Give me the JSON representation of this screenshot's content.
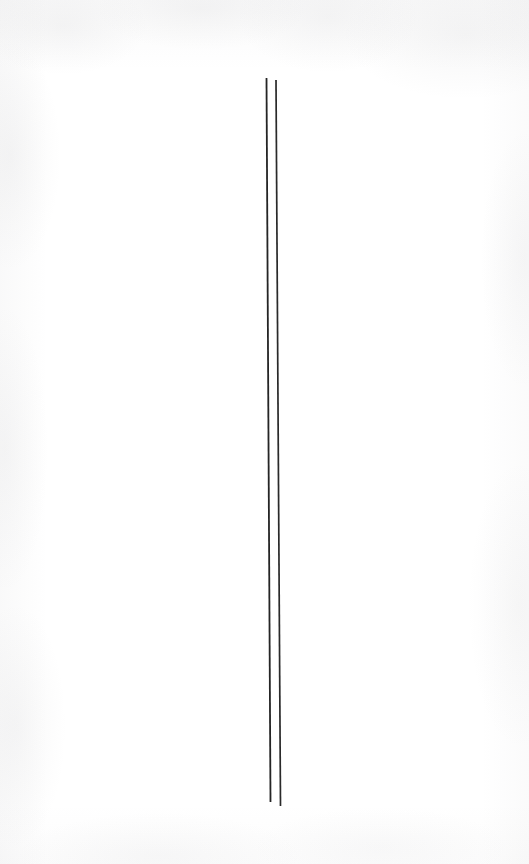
{
  "artwork": {
    "title": "Two Vertical Lines",
    "description": "A minimal composition of two thin, nearly vertical dark strokes on a near-white paper ground.",
    "canvas": {
      "width": 529,
      "height": 864,
      "background_color": "#fefefe",
      "paper_tint": "#ffffff",
      "texture_color": "#8c8c91"
    },
    "strokes": [
      {
        "name": "left-line",
        "color": "#1a1a1a",
        "width": 1.8,
        "x_top": 266.5,
        "y_top": 78,
        "x_bottom": 270.5,
        "y_bottom": 802,
        "opacity": 0.95
      },
      {
        "name": "right-line",
        "color": "#1a1a1a",
        "width": 1.7,
        "x_top": 276.0,
        "y_top": 80,
        "x_bottom": 280.5,
        "y_bottom": 806,
        "opacity": 0.93
      }
    ],
    "gap_top_px": 9.5,
    "gap_bottom_px": 10.0
  }
}
